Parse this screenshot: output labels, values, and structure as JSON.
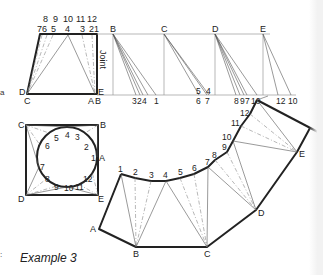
{
  "caption": "Example 3",
  "edge_marks": {
    "a": "a",
    "c": "c",
    "colon": ":"
  },
  "elevation": {
    "top_labels_row1": [
      "8",
      "9",
      "10",
      "11",
      "12"
    ],
    "top_labels_row2": [
      "7",
      "6",
      "5",
      "4",
      "3",
      "2",
      "1"
    ],
    "corner_labels": {
      "D": "D",
      "C": "C",
      "A": "A",
      "B": "B",
      "E": "E"
    },
    "joint_label": "Joint"
  },
  "true_lengths": {
    "verticals": [
      "B",
      "C",
      "D",
      "E"
    ],
    "base_labels_B": [
      "3",
      "2",
      "4",
      "1"
    ],
    "base_labels_C_upper": [
      "5",
      "4"
    ],
    "base_labels_C_lower": [
      "6",
      "7"
    ],
    "base_labels_D": [
      "8",
      "9",
      "7",
      "10"
    ],
    "base_labels_E": [
      "12",
      "10"
    ]
  },
  "plan": {
    "corner_labels": {
      "C": "C",
      "B": "B",
      "A": "A",
      "D": "D",
      "E": "E"
    },
    "circle_points": [
      "1",
      "2",
      "3",
      "4",
      "5",
      "6",
      "7",
      "8",
      "9",
      "10",
      "11",
      "12"
    ]
  },
  "development": {
    "curve_points": [
      "1",
      "2",
      "3",
      "4",
      "5",
      "6",
      "7",
      "8",
      "9",
      "10",
      "11",
      "12"
    ],
    "base_points": [
      "A",
      "B",
      "C",
      "D",
      "E"
    ]
  }
}
